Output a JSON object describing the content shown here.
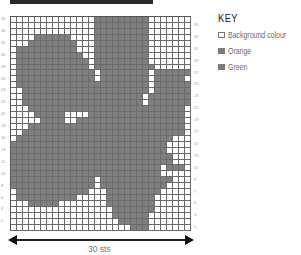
{
  "chart": {
    "stitch_count_label": "30 sts",
    "columns": 30,
    "rows": 36,
    "right_row_labels": [
      "35",
      "33",
      "31",
      "29",
      "27",
      "25",
      "23",
      "21",
      "19",
      "17",
      "15",
      "13",
      "11",
      "9",
      "7",
      "5",
      "3",
      "1"
    ],
    "left_row_labels": [
      "36",
      "34",
      "32",
      "30",
      "28",
      "26",
      "24",
      "22",
      "20",
      "18",
      "16",
      "14",
      "12",
      "10",
      "8",
      "6",
      "4",
      "2"
    ],
    "grid": [
      "..............#########.......",
      "..............#########.......",
      "..............#########.......",
      "....######....#########.......",
      "...########...#########.......",
      ".##########...#########.......",
      ".###########..#########.......",
      ".############.#########.......",
      ".############.##########......",
      ".#############.########.######",
      ".#############.########.#####.",
      ".######################.######",
      "..#####################.######",
      "..####################.#######",
      "..####################.#######",
      "...##########################.",
      "....#####....################.",
      ".....####..##################.",
      "...##########################.",
      "..###########################.",
      ".##########################...",
      "##########################....",
      "##########################....",
      "###########################...",
      "###########################...",
      "#########################.###.",
      "#########################....",
      "##############.############...",
      "##############.###########....",
      ".############...#########.....",
      ".##########.....########......",
      "...#####........########......",
      ".................#######......",
      ".................######.......",
      "..................#####.......",
      "....................###......."
    ]
  },
  "key": {
    "title": "KEY",
    "items": [
      {
        "label": "Background colour",
        "color": "#ffffff"
      },
      {
        "label": "Orange",
        "color": "#7a7a7a"
      },
      {
        "label": "Green",
        "color": "#7a7a7a"
      }
    ]
  },
  "colors": {
    "filled": "#7f7f7f",
    "background": "#ffffff",
    "gridline": "#6a6a6a"
  }
}
